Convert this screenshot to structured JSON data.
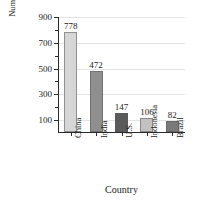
{
  "chart_data": {
    "type": "bar",
    "title": "",
    "xlabel": "Country",
    "ylabel": "Number of Workers (millions)",
    "ylabel_line1": "Number of Workers",
    "ylabel_line2": "(millions)",
    "categories": [
      "China",
      "India",
      "U.S.",
      "Indonesia",
      "Brazil"
    ],
    "values": [
      778,
      472,
      147,
      106,
      82
    ],
    "value_labels": [
      "778",
      "472",
      "147",
      "106",
      "82"
    ],
    "ylim": [
      0,
      900
    ],
    "ytick_labels": [
      "900",
      "700",
      "500",
      "300",
      "100"
    ],
    "ytick_values": [
      900,
      700,
      500,
      300,
      100
    ],
    "yminor_values": [
      800,
      600,
      400,
      200
    ],
    "grid": true,
    "legend": "none",
    "bar_colors": [
      "#d6d6d6",
      "#8f8f8f",
      "#5a5a5a",
      "#c2c2c2",
      "#7a7a7a"
    ],
    "axis_color": "#2b2b2b",
    "grid_color": "#e4e4e4"
  }
}
